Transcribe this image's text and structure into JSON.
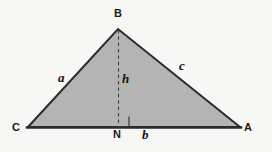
{
  "figure": {
    "name": "triangle-with-altitude",
    "background_color": "#f7f7f5",
    "fill_color": "#b4b4b4",
    "stroke_color": "#2b2b2b",
    "dash_color": "#3a3a3a"
  },
  "vertices": {
    "apex": {
      "label": "B",
      "x": 118,
      "y": 29
    },
    "left": {
      "label": "C",
      "x": 28,
      "y": 127
    },
    "right": {
      "label": "A",
      "x": 240,
      "y": 127
    },
    "foot": {
      "label": "N",
      "x": 118,
      "y": 127
    }
  },
  "labels": {
    "vertex_b": "B",
    "vertex_c": "C",
    "vertex_a": "A",
    "vertex_n": "N",
    "side_a": "a",
    "side_c": "c",
    "altitude_h": "h",
    "base_b": "b"
  },
  "markers": {
    "right_angle": "right-angle-square"
  }
}
